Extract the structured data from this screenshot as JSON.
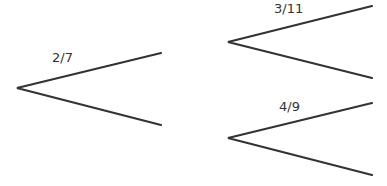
{
  "diagram": {
    "type": "probability tree",
    "line_color": "#333333",
    "branches": [
      {
        "id": "first",
        "label": "2/7"
      },
      {
        "id": "second-top",
        "label": "3/11"
      },
      {
        "id": "second-bottom",
        "label": "4/9"
      }
    ]
  }
}
